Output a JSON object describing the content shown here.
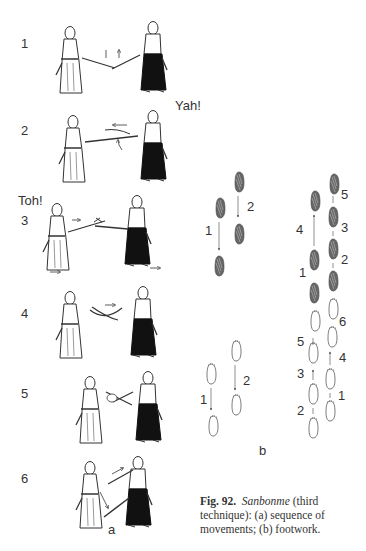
{
  "figure": {
    "number": "Fig. 92.",
    "technique_name": "Sanbonme",
    "caption_rest": " (third technique): (a) sequence of movements; (b) footwork.",
    "caption_lines": [
      "Fig. 92.  Sanbonme (third",
      "technique): (a) sequence of",
      "movements; (b) footwork."
    ]
  },
  "sequence_panel": {
    "sublabel": "a",
    "steps": [
      {
        "number": "1",
        "shout": ""
      },
      {
        "number": "2",
        "shout": "Yah!"
      },
      {
        "number": "3",
        "shout": "Toh!"
      },
      {
        "number": "4",
        "shout": ""
      },
      {
        "number": "5",
        "shout": ""
      },
      {
        "number": "6",
        "shout": ""
      }
    ]
  },
  "footwork_panel": {
    "sublabel": "b",
    "shaded_left_diagram": {
      "step_labels": [
        "2",
        "1"
      ]
    },
    "outline_left_diagram": {
      "step_labels": [
        "2",
        "1"
      ]
    },
    "shaded_right_diagram": {
      "step_labels": [
        "5",
        "4",
        "3",
        "2",
        "1"
      ]
    },
    "outline_right_diagram": {
      "step_labels": [
        "6",
        "5",
        "4",
        "3",
        "1",
        "2"
      ]
    }
  }
}
